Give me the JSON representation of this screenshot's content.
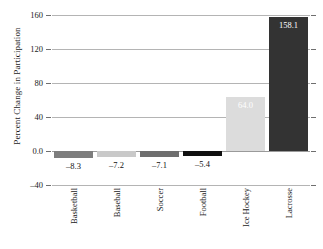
{
  "chart_data": {
    "type": "bar",
    "title": "",
    "xlabel": "",
    "ylabel": "Percent Change in Participation",
    "categories": [
      "Basketball",
      "Baseball",
      "Soccer",
      "Football",
      "Ice Hockey",
      "Lacrosse"
    ],
    "values": [
      -8.3,
      -7.2,
      -7.1,
      -5.4,
      64.0,
      158.1
    ],
    "value_labels": [
      "–8.3",
      "–7.2",
      "–7.1",
      "–5.4",
      "64.0",
      "158.1"
    ],
    "bar_colors": [
      "#7d7d7d",
      "#c9c9c9",
      "#6e6e6e",
      "#101010",
      "#dcdcdc",
      "#333333"
    ],
    "label_placement": [
      "below",
      "below",
      "below",
      "below",
      "inside",
      "inside"
    ],
    "ylim": [
      -40,
      160
    ],
    "yticks": [
      160,
      120,
      80,
      40,
      0,
      -40
    ],
    "ytick_labels": [
      "160",
      "120",
      "80",
      "40",
      "0.0",
      "–40"
    ],
    "grid": true,
    "grid_axis": "y",
    "legend": "none"
  },
  "axis": {
    "y_title": "Percent Change in Participation"
  }
}
